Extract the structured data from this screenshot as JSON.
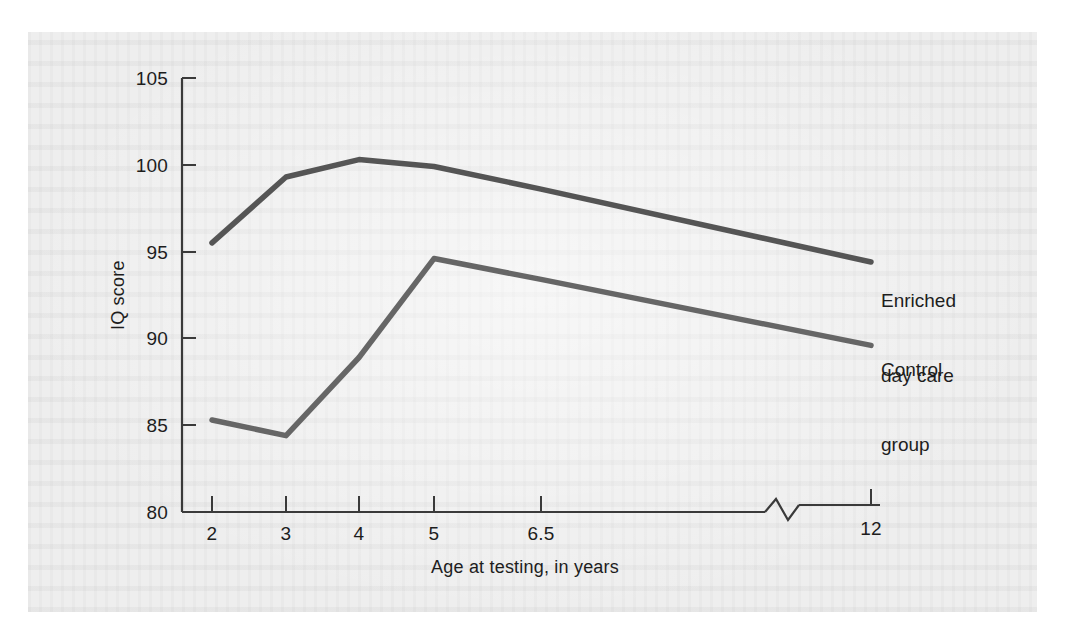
{
  "figure": {
    "background_color": "#ffffff",
    "page_color": "#eeeeee",
    "axis_color": "#3a3a3a",
    "text_color": "#1d1d1d"
  },
  "chart_data": {
    "type": "line",
    "title": "",
    "subtitle": "",
    "xlabel": "Age at testing, in years",
    "ylabel": "IQ score",
    "categories": [
      "2",
      "3",
      "4",
      "5",
      "6.5",
      "12"
    ],
    "x_tick_labels": [
      "2",
      "3",
      "4",
      "5",
      "6.5",
      "12"
    ],
    "y_tick_labels": [
      "80",
      "85",
      "90",
      "95",
      "100",
      "105"
    ],
    "y_ticks": [
      80,
      85,
      90,
      95,
      100,
      105
    ],
    "ylim": [
      80,
      105
    ],
    "grid": false,
    "legend_position": "right-inline-labels",
    "axis_break": {
      "axis": "x",
      "between": [
        "6.5",
        "12"
      ],
      "style": "zigzag"
    },
    "annotations": [
      {
        "text": "Enriched day care",
        "attached_to": "Enriched day care"
      },
      {
        "text": "Control group",
        "attached_to": "Control group"
      }
    ],
    "series": [
      {
        "name": "Enriched day care",
        "label_line1": "Enriched",
        "label_line2": "day care",
        "color": "#555555",
        "values": [
          95.5,
          99.3,
          100.3,
          99.9,
          98.6,
          94.4
        ]
      },
      {
        "name": "Control group",
        "label_line1": "Control",
        "label_line2": "group",
        "color": "#666666",
        "values": [
          85.3,
          84.4,
          88.9,
          94.6,
          93.4,
          89.6
        ]
      }
    ]
  },
  "axes": {
    "x_axis_title": "Age at testing, in years",
    "y_axis_title": "IQ score"
  }
}
